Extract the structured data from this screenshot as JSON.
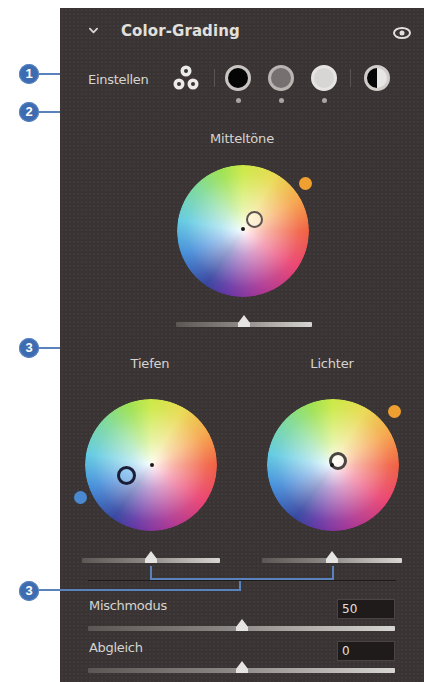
{
  "panel": {
    "title": "Color-Grading",
    "collapse_icon": "chevron-down-icon",
    "visibility_icon": "eye-icon"
  },
  "adjust": {
    "label": "Einstellen",
    "modes": [
      {
        "name": "3-way",
        "icon": "three-circles-icon"
      },
      {
        "name": "shadows",
        "icon": "black-circle-icon"
      },
      {
        "name": "midtones",
        "icon": "gray-circle-icon"
      },
      {
        "name": "highlights",
        "icon": "white-circle-icon"
      },
      {
        "name": "global",
        "icon": "half-circle-icon"
      }
    ]
  },
  "wheels": {
    "midtones": {
      "label": "Mitteltöne",
      "hue_color": "#f0a030",
      "luminance_pct": 50
    },
    "shadows": {
      "label": "Tiefen",
      "hue_color": "#4a88d0",
      "luminance_pct": 50
    },
    "highlights": {
      "label": "Lichter",
      "hue_color": "#f0a030",
      "luminance_pct": 50
    }
  },
  "blending": {
    "label": "Mischmodus",
    "value": "50"
  },
  "balance": {
    "label": "Abgleich",
    "value": "0"
  },
  "callouts": [
    "1",
    "2",
    "3",
    "3"
  ],
  "colors": {
    "panel_bg": "#3a3534",
    "callout_blue": "#3e6cb0",
    "text": "#d6d4d1"
  }
}
